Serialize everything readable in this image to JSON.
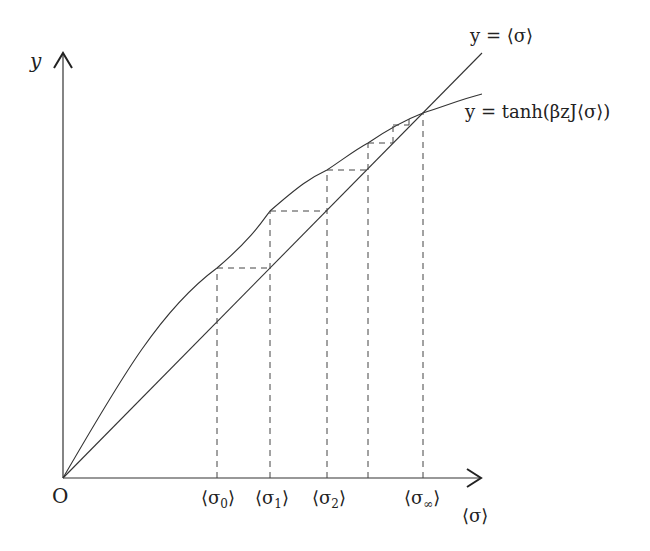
{
  "diagram": {
    "axes": {
      "y_label": "y",
      "x_label": "⟨σ⟩",
      "origin_label": "O"
    },
    "curves": {
      "line_label": "y = ⟨σ⟩",
      "tanh_label": "y = tanh(βzJ⟨σ⟩)"
    },
    "x_ticks": [
      {
        "label": "⟨σ₀⟩",
        "base": "⟨σ",
        "sub": "0",
        "close": "⟩"
      },
      {
        "label": "⟨σ₁⟩",
        "base": "⟨σ",
        "sub": "1",
        "close": "⟩"
      },
      {
        "label": "⟨σ₂⟩",
        "base": "⟨σ",
        "sub": "2",
        "close": "⟩"
      },
      {
        "label": "⟨σ∞⟩",
        "base": "⟨σ",
        "sub": "∞",
        "close": "⟩"
      }
    ],
    "colors": {
      "line": "#333333",
      "dashed": "#444444",
      "text": "#222222"
    }
  }
}
